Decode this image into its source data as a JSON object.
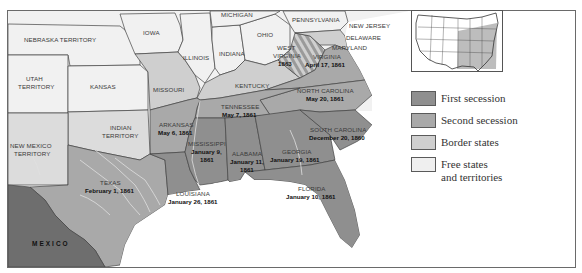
{
  "map": {
    "title": "Secession of Southern States",
    "regions": {
      "nebraska": "NEBRASKA TERRITORY",
      "iowa": "IOWA",
      "michigan": "MICHIGAN",
      "pennsylvania": "PENNSYLVANIA",
      "new_jersey": "NEW JERSEY",
      "delaware": "DELAWARE",
      "maryland": "MARYLAND",
      "illinois": "ILLINOIS",
      "indiana": "INDIANA",
      "ohio": "OHIO",
      "west_virginia_1": "WEST",
      "west_virginia_2": "VIRGINIA",
      "west_virginia_date": "1863",
      "virginia": "VIRGINIA",
      "virginia_date": "April 17, 1861",
      "utah_1": "UTAH",
      "utah_2": "TERRITORY",
      "kansas": "KANSAS",
      "missouri": "MISSOURI",
      "kentucky": "KENTUCKY",
      "north_carolina": "NORTH CAROLINA",
      "north_carolina_date": "May 20, 1861",
      "tennessee": "TENNESSEE",
      "tennessee_date": "May 7, 1861",
      "indian_1": "INDIAN",
      "indian_2": "TERRITORY",
      "arkansas": "ARKANSAS",
      "arkansas_date": "May 6, 1861",
      "south_carolina": "SOUTH CAROLINA",
      "south_carolina_date": "December 20, 1860",
      "new_mexico_1": "NEW MEXICO",
      "new_mexico_2": "TERRITORY",
      "mississippi": "MISSISSIPPI",
      "mississippi_date_1": "January 9,",
      "mississippi_date_2": "1861",
      "alabama": "ALABAMA",
      "alabama_date_1": "January 11,",
      "alabama_date_2": "1861",
      "georgia": "GEORGIA",
      "georgia_date": "January 19, 1861",
      "texas": "TEXAS",
      "texas_date": "February 1, 1861",
      "louisiana": "LOUISIANA",
      "louisiana_date": "January 26, 1861",
      "florida": "FLORIDA",
      "florida_date": "January 10, 1861",
      "mexico": "MEXICO"
    }
  },
  "legend": {
    "items": [
      {
        "label": "First secession",
        "color": "#8f8f8f"
      },
      {
        "label": "Second secession",
        "color": "#a9a9a9"
      },
      {
        "label": "Border states",
        "color": "#cfcfcf"
      },
      {
        "label": "Free states",
        "label2": "and territories",
        "color": "#efefef"
      }
    ]
  },
  "colors": {
    "first": "#8f8f8f",
    "second": "#a9a9a9",
    "border": "#cfcfcf",
    "free": "#f1f1f1",
    "mexico": "#6e6e6e",
    "water": "#ffffff",
    "rivers": "#d8d8d8"
  }
}
